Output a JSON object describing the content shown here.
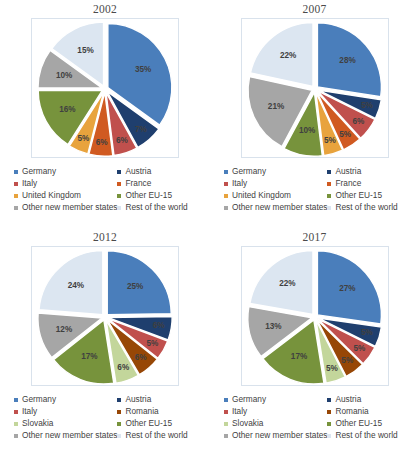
{
  "chart_data": [
    {
      "type": "pie",
      "title": "2002",
      "categories": [
        "Germany",
        "Austria",
        "Italy",
        "France",
        "United Kingdom",
        "Other EU-15",
        "Other new member states",
        "Rest of the world"
      ],
      "values": [
        35,
        7,
        6,
        6,
        5,
        16,
        10,
        15
      ],
      "labels": [
        "35%",
        "7%",
        "6%",
        "6%",
        "5%",
        "16%",
        "10%",
        "15%"
      ],
      "colors": [
        "#4a7ebb",
        "#1f3f6e",
        "#c0504d",
        "#d05a21",
        "#e8a33d",
        "#77933c",
        "#a6a6a6",
        "#dce6f1"
      ],
      "legend_position": "bottom",
      "xlabel": "",
      "ylabel": ""
    },
    {
      "type": "pie",
      "title": "2007",
      "categories": [
        "Germany",
        "Austria",
        "Italy",
        "France",
        "United Kingdom",
        "Other EU-15",
        "Other new member states",
        "Rest of the world"
      ],
      "values": [
        28,
        5,
        6,
        5,
        5,
        10,
        21,
        22
      ],
      "labels": [
        "28%",
        "5%",
        "6%",
        "5%",
        "5%",
        "10%",
        "21%",
        "22%"
      ],
      "colors": [
        "#4a7ebb",
        "#1f3f6e",
        "#c0504d",
        "#d05a21",
        "#e8a33d",
        "#77933c",
        "#a6a6a6",
        "#dce6f1"
      ],
      "legend_position": "bottom",
      "xlabel": "",
      "ylabel": ""
    },
    {
      "type": "pie",
      "title": "2012",
      "categories": [
        "Germany",
        "Austria",
        "Italy",
        "Romania",
        "Slovakia",
        "Other EU-15",
        "Other new member states",
        "Rest of the world"
      ],
      "values": [
        25,
        6,
        5,
        6,
        6,
        17,
        12,
        24
      ],
      "labels": [
        "25%",
        "6%",
        "5%",
        "6%",
        "6%",
        "17%",
        "12%",
        "24%"
      ],
      "colors": [
        "#4a7ebb",
        "#1f3f6e",
        "#c0504d",
        "#974706",
        "#c3d69b",
        "#77933c",
        "#a6a6a6",
        "#dce6f1"
      ],
      "legend_position": "bottom",
      "xlabel": "",
      "ylabel": ""
    },
    {
      "type": "pie",
      "title": "2017",
      "categories": [
        "Germany",
        "Austria",
        "Italy",
        "Romania",
        "Slovakia",
        "Other EU-15",
        "Other new member states",
        "Rest of the world"
      ],
      "values": [
        27,
        5,
        5,
        5,
        5,
        17,
        13,
        22
      ],
      "labels": [
        "27%",
        "5%",
        "5%",
        "5%",
        "5%",
        "17%",
        "13%",
        "22%"
      ],
      "colors": [
        "#4a7ebb",
        "#1f3f6e",
        "#c0504d",
        "#974706",
        "#c3d69b",
        "#77933c",
        "#a6a6a6",
        "#dce6f1"
      ],
      "legend_position": "bottom",
      "xlabel": "",
      "ylabel": ""
    }
  ],
  "charts": {
    "chart0": {
      "title": "2002",
      "legend": [
        {
          "label": "Germany",
          "color": "#4a7ebb"
        },
        {
          "label": "Austria",
          "color": "#1f3f6e"
        },
        {
          "label": "Italy",
          "color": "#c0504d"
        },
        {
          "label": "France",
          "color": "#d05a21"
        },
        {
          "label": "United Kingdom",
          "color": "#e8a33d"
        },
        {
          "label": "Other EU-15",
          "color": "#77933c"
        },
        {
          "label": "Other new member states",
          "color": "#a6a6a6"
        },
        {
          "label": "Rest of the world",
          "color": "#dce6f1"
        }
      ]
    },
    "chart1": {
      "title": "2007",
      "legend": [
        {
          "label": "Germany",
          "color": "#4a7ebb"
        },
        {
          "label": "Austria",
          "color": "#1f3f6e"
        },
        {
          "label": "Italy",
          "color": "#c0504d"
        },
        {
          "label": "France",
          "color": "#d05a21"
        },
        {
          "label": "United Kingdom",
          "color": "#e8a33d"
        },
        {
          "label": "Other EU-15",
          "color": "#77933c"
        },
        {
          "label": "Other new member states",
          "color": "#a6a6a6"
        },
        {
          "label": "Rest of the world",
          "color": "#dce6f1"
        }
      ]
    },
    "chart2": {
      "title": "2012",
      "legend": [
        {
          "label": "Germany",
          "color": "#4a7ebb"
        },
        {
          "label": "Austria",
          "color": "#1f3f6e"
        },
        {
          "label": "Italy",
          "color": "#c0504d"
        },
        {
          "label": "Romania",
          "color": "#974706"
        },
        {
          "label": "Slovakia",
          "color": "#c3d69b"
        },
        {
          "label": "Other EU-15",
          "color": "#77933c"
        },
        {
          "label": "Other new member states",
          "color": "#a6a6a6"
        },
        {
          "label": "Rest of the world",
          "color": "#dce6f1"
        }
      ]
    },
    "chart3": {
      "title": "2017",
      "legend": [
        {
          "label": "Germany",
          "color": "#4a7ebb"
        },
        {
          "label": "Austria",
          "color": "#1f3f6e"
        },
        {
          "label": "Italy",
          "color": "#c0504d"
        },
        {
          "label": "Romania",
          "color": "#974706"
        },
        {
          "label": "Slovakia",
          "color": "#c3d69b"
        },
        {
          "label": "Other EU-15",
          "color": "#77933c"
        },
        {
          "label": "Other new member states",
          "color": "#a6a6a6"
        },
        {
          "label": "Rest of the world",
          "color": "#dce6f1"
        }
      ]
    }
  }
}
